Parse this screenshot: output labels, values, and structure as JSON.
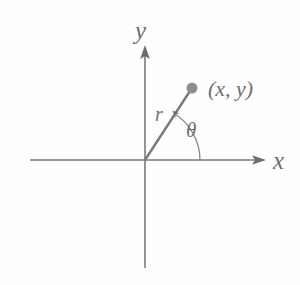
{
  "figure": {
    "type": "polar-coordinates-diagram",
    "background_color": "#fefefe",
    "stroke_color": "#7a7a7a",
    "text_color": "#6e6e6e",
    "labels": {
      "y_axis": "y",
      "x_axis": "x",
      "radius": "r",
      "angle": "θ",
      "point": "(x, y)"
    },
    "geometry": {
      "origin": {
        "x": 145,
        "y": 160
      },
      "x_axis": {
        "x1": 30,
        "y1": 160,
        "x2": 265,
        "y2": 160,
        "arrow_at": "end"
      },
      "y_axis": {
        "x1": 145,
        "y1": 268,
        "x2": 145,
        "y2": 46,
        "arrow_at": "top"
      },
      "ray": {
        "x1": 145,
        "y1": 160,
        "x2": 190,
        "y2": 91
      },
      "point_marker": {
        "cx": 192,
        "cy": 88,
        "r": 5.5
      },
      "angle_arc": {
        "center_x": 145,
        "center_y": 160,
        "radius": 55,
        "start_deg": 0,
        "end_deg": 57,
        "arrow_at": "end"
      }
    }
  }
}
